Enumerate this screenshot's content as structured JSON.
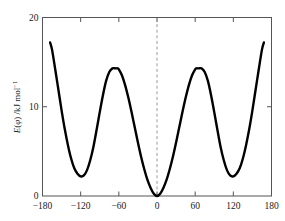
{
  "chart_data": {
    "type": "line",
    "title": "",
    "subtitle": "",
    "xlabel": "",
    "ylabel": "E(φ) /kJ mol⁻¹",
    "ylabel_parts": {
      "symbol": "E",
      "open_paren": "(",
      "variable": "φ",
      "close_paren": ")",
      "units": " /kJ mol",
      "exponent": "−1"
    },
    "xlim": [
      -180,
      180
    ],
    "ylim": [
      0,
      20
    ],
    "xticks": [
      -180,
      -120,
      -60,
      0,
      60,
      120,
      180
    ],
    "xtick_labels": [
      "−180",
      "−120",
      "−60",
      "0",
      "60",
      "120",
      "180"
    ],
    "yticks": [
      0,
      10,
      20
    ],
    "ytick_labels": [
      "0",
      "10",
      "20"
    ],
    "grid": false,
    "legend": null,
    "legend_position": "none",
    "line_color": "#000000",
    "line_width": 2.4,
    "frame_color": "#555555",
    "background_color": "#ffffff",
    "annotations": [
      {
        "name": "zero-reference-line",
        "type": "vline",
        "x": 0,
        "style": "dashed",
        "color": "#999999"
      }
    ],
    "series": [
      {
        "name": "torsional-energy",
        "x": [
          -168,
          -165,
          -160,
          -155,
          -150,
          -145,
          -140,
          -135,
          -130,
          -125,
          -120,
          -115,
          -110,
          -105,
          -100,
          -95,
          -90,
          -85,
          -80,
          -75,
          -70,
          -65,
          -62,
          -60,
          -55,
          -50,
          -45,
          -40,
          -35,
          -30,
          -25,
          -20,
          -15,
          -10,
          -5,
          0,
          5,
          10,
          15,
          20,
          25,
          30,
          35,
          40,
          45,
          50,
          55,
          60,
          62,
          65,
          70,
          75,
          80,
          85,
          90,
          95,
          100,
          105,
          110,
          115,
          120,
          125,
          130,
          135,
          140,
          145,
          150,
          155,
          160,
          165,
          168
        ],
        "y": [
          17.2,
          16.4,
          14.2,
          11.9,
          9.6,
          7.5,
          5.7,
          4.2,
          3.1,
          2.5,
          2.2,
          2.3,
          2.9,
          4.0,
          5.5,
          7.4,
          9.4,
          11.3,
          12.9,
          13.9,
          14.3,
          14.3,
          14.3,
          14.2,
          13.5,
          12.4,
          11.0,
          9.4,
          7.7,
          6.0,
          4.4,
          3.0,
          1.8,
          0.9,
          0.25,
          0.0,
          0.25,
          0.9,
          1.8,
          3.0,
          4.4,
          6.0,
          7.7,
          9.4,
          11.0,
          12.4,
          13.5,
          14.2,
          14.3,
          14.3,
          14.3,
          13.9,
          12.9,
          11.3,
          9.4,
          7.4,
          5.5,
          4.0,
          2.9,
          2.3,
          2.2,
          2.5,
          3.1,
          4.2,
          5.7,
          7.5,
          9.6,
          11.9,
          14.2,
          16.4,
          17.2
        ],
        "key_points": {
          "global_minimum": {
            "x": 0,
            "y": 0
          },
          "local_minima": [
            {
              "x": -120,
              "y": 2.2
            },
            {
              "x": 120,
              "y": 2.2
            }
          ],
          "maxima": [
            {
              "x": -62,
              "y": 14.3
            },
            {
              "x": 62,
              "y": 14.3
            }
          ],
          "endpoints": [
            {
              "x": -168,
              "y": 17.2
            },
            {
              "x": 168,
              "y": 17.2
            }
          ]
        }
      }
    ]
  }
}
